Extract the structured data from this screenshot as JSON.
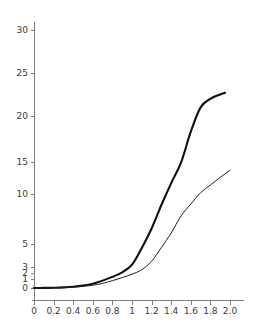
{
  "chart_data": {
    "type": "line",
    "title": "",
    "subtitle": "",
    "xlabel": "",
    "ylabel": "",
    "xlim": [
      0,
      2.0
    ],
    "ylim": [
      0,
      30
    ],
    "grid": false,
    "legend": null,
    "y_scale": "nonlinear-compressed",
    "x_ticks": [
      0,
      0.2,
      0.4,
      0.6,
      0.8,
      1,
      1.2,
      1.4,
      1.6,
      1.8,
      2.0
    ],
    "x_tick_labels": [
      "0",
      "0.2",
      "0.4",
      "0.6",
      "0.8",
      "1",
      "1.2",
      "1.4",
      "1.6",
      "1.8",
      "2.0"
    ],
    "y_ticks": [
      0,
      1,
      2,
      3,
      5,
      10,
      15,
      20,
      25,
      30
    ],
    "y_tick_labels": [
      "0",
      "1",
      "2",
      "3",
      "5",
      "10",
      "15",
      "20",
      "25",
      "30"
    ],
    "series": [
      {
        "name": "upper-curve",
        "style": "thick",
        "color": "#101010",
        "x": [
          0,
          0.1,
          0.2,
          0.3,
          0.4,
          0.5,
          0.6,
          0.7,
          0.8,
          0.9,
          1.0,
          1.1,
          1.2,
          1.3,
          1.4,
          1.5,
          1.6,
          1.7,
          1.8,
          1.9,
          1.95
        ],
        "values": [
          0,
          0.01,
          0.03,
          0.07,
          0.14,
          0.27,
          0.48,
          0.82,
          1.35,
          2.12,
          3.2,
          4.66,
          6.55,
          8.9,
          11.7,
          14.9,
          18.3,
          21.0,
          22.0,
          22.5,
          22.7
        ]
      },
      {
        "name": "lower-curve",
        "style": "thin",
        "color": "#202020",
        "x": [
          0,
          0.1,
          0.2,
          0.3,
          0.4,
          0.5,
          0.6,
          0.7,
          0.8,
          0.9,
          1.0,
          1.1,
          1.2,
          1.3,
          1.4,
          1.5,
          1.6,
          1.7,
          1.8,
          1.9,
          2.0
        ],
        "values": [
          0,
          0.005,
          0.02,
          0.05,
          0.1,
          0.18,
          0.31,
          0.51,
          0.81,
          1.23,
          1.8,
          2.55,
          3.5,
          4.7,
          6.1,
          7.8,
          9.0,
          10.2,
          11.4,
          12.6,
          13.7
        ]
      }
    ]
  },
  "axes": {
    "y_axis_name": "vertical-axis",
    "x_axis_name": "horizontal-axis"
  }
}
